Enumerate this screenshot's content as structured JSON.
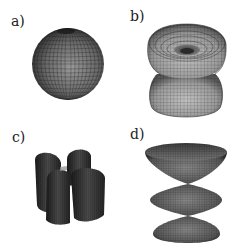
{
  "figure": {
    "panels": [
      {
        "id": "a",
        "label": "a)",
        "shape": "sphere"
      },
      {
        "id": "b",
        "label": "b)",
        "shape": "double-torus-surface"
      },
      {
        "id": "c",
        "label": "c)",
        "shape": "four-lobed-cylinder-surface"
      },
      {
        "id": "d",
        "label": "d)",
        "shape": "stacked-lens-surface"
      }
    ],
    "colors": {
      "background": "#ffffff",
      "surface_dark": "#2a2a2a",
      "surface_mid": "#6e6e6e",
      "surface_light": "#b5b5b5",
      "mesh": "#1e1e1e",
      "label": "#222222"
    }
  }
}
